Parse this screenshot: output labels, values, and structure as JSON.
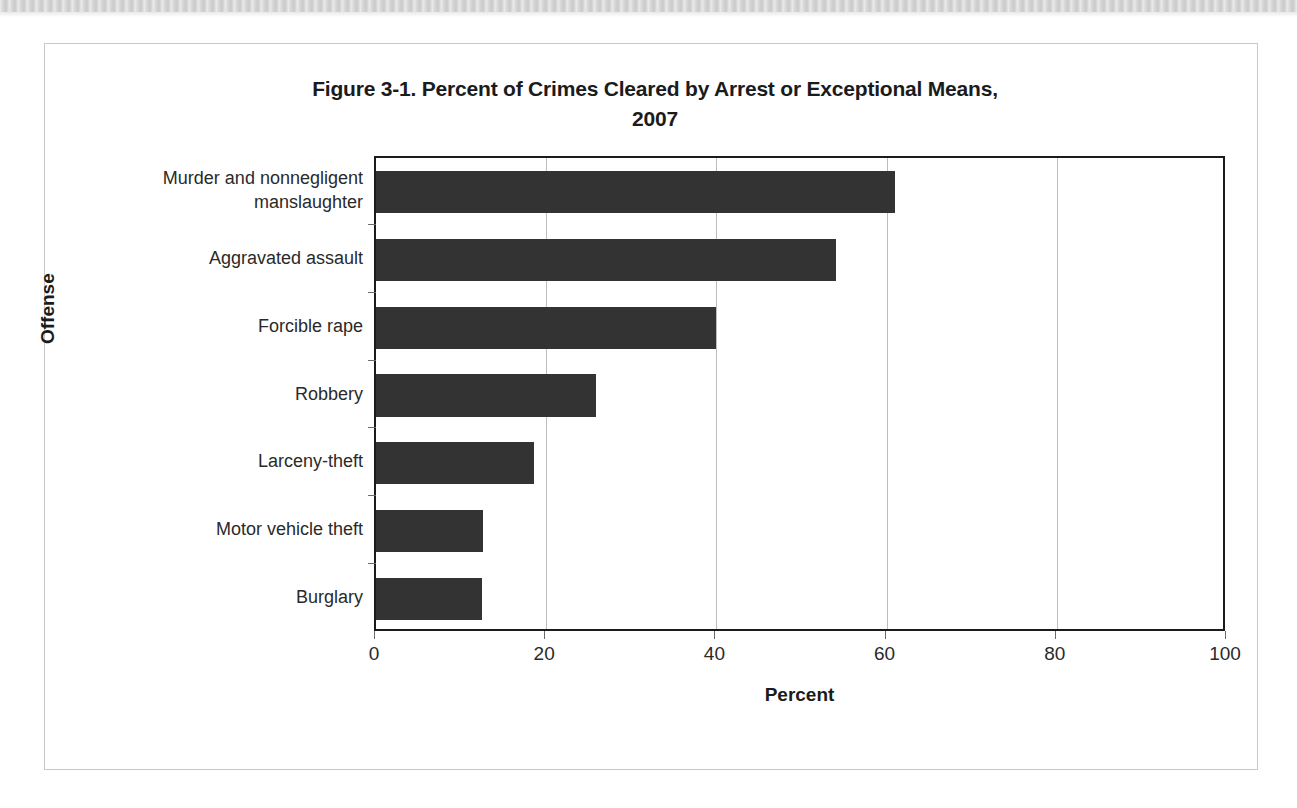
{
  "page": {
    "background": "#ffffff",
    "scan_strip_color": "#d6d6d6"
  },
  "figure": {
    "frame_color": "#c8c8c8",
    "title": "Figure 3-1. Percent of Crimes Cleared by Arrest or Exceptional Means, 2007"
  },
  "chart_data": {
    "type": "bar",
    "orientation": "horizontal",
    "title": "Figure 3-1. Percent of Crimes Cleared by Arrest or Exceptional Means, 2007",
    "title_line1": "Figure 3-1. Percent of Crimes Cleared by Arrest or Exceptional Means,",
    "title_line2": "2007",
    "xlabel": "Percent",
    "ylabel": "Offense",
    "categories": [
      "Murder and nonnegligent manslaughter",
      "Aggravated assault",
      "Forcible rape",
      "Robbery",
      "Larceny-theft",
      "Motor vehicle theft",
      "Burglary"
    ],
    "category_lines": [
      [
        "Murder and nonnegligent",
        "manslaughter"
      ],
      [
        "Aggravated assault"
      ],
      [
        "Forcible rape"
      ],
      [
        "Robbery"
      ],
      [
        "Larceny-theft"
      ],
      [
        "Motor vehicle theft"
      ],
      [
        "Burglary"
      ]
    ],
    "values": [
      61.0,
      54.1,
      40.0,
      25.9,
      18.6,
      12.6,
      12.4
    ],
    "xlim": [
      0,
      100
    ],
    "xticks": [
      0,
      20,
      40,
      60,
      80,
      100
    ],
    "xticklabels": [
      "0",
      "20",
      "40",
      "60",
      "80",
      "100"
    ],
    "grid": "vertical",
    "legend": "none",
    "bar_color": "#333333",
    "axis_color": "#1b1b1b",
    "gridline_color": "#bdbdbd"
  }
}
